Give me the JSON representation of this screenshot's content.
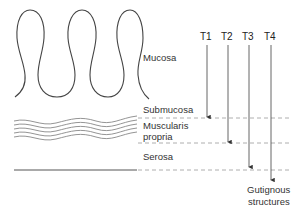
{
  "diagram": {
    "layers": [
      {
        "id": "mucosa",
        "label": "Mucosa"
      },
      {
        "id": "submucosa",
        "label": "Submucosa"
      },
      {
        "id": "muscularis",
        "label_line1": "Muscularis",
        "label_line2": "propria"
      },
      {
        "id": "serosa",
        "label": "Serosa"
      }
    ],
    "stages": [
      {
        "label": "T1",
        "ends_at": "submucosa"
      },
      {
        "label": "T2",
        "ends_at": "muscularis propria"
      },
      {
        "label": "T3",
        "ends_at": "serosa"
      },
      {
        "label": "T4",
        "ends_at": "gutignous structures"
      }
    ],
    "bottom_label_line1": "Gutignous",
    "bottom_label_line2": "structures",
    "colors": {
      "line": "#555555",
      "dash": "#999999",
      "wave": "#888888"
    }
  }
}
